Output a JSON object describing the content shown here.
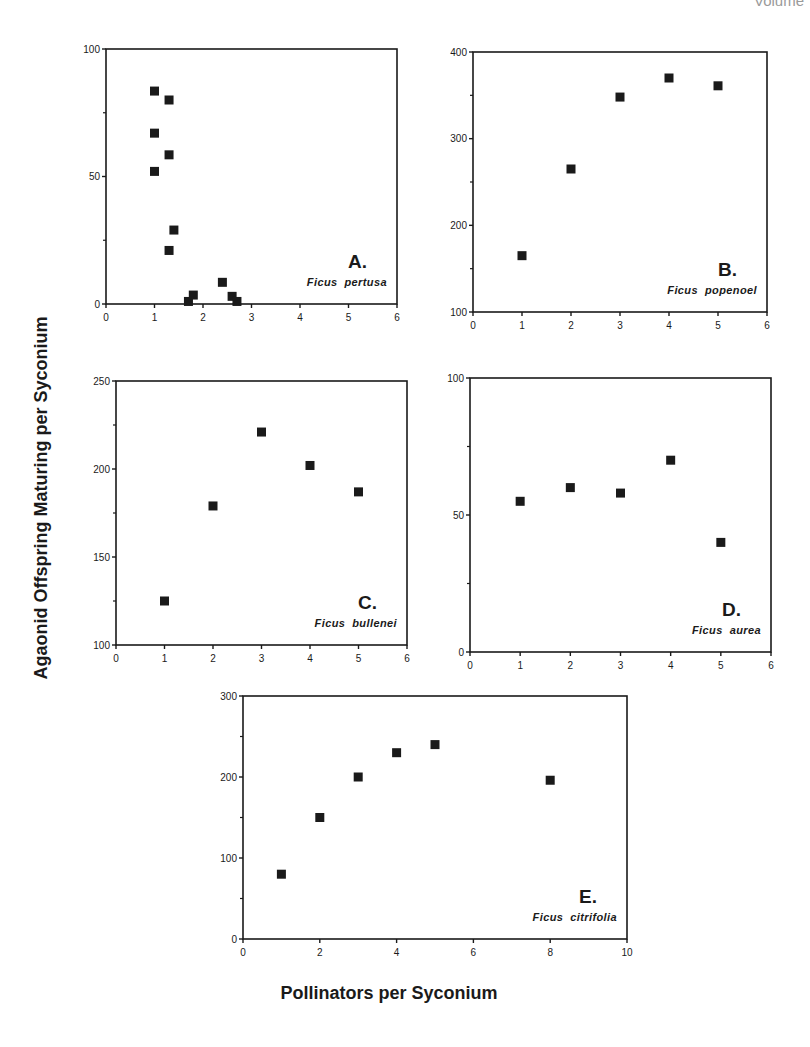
{
  "page": {
    "header_fragment": "Volume"
  },
  "axes": {
    "ylabel": "Agaonid Offspring Maturing per Syconium",
    "xlabel": "Pollinators per Syconium"
  },
  "chart_data": [
    {
      "type": "scatter",
      "panel": "A.",
      "species": "Ficus  pertusa",
      "xlim": [
        0,
        6
      ],
      "ylim": [
        0,
        100
      ],
      "xticks": [
        0,
        1,
        2,
        3,
        4,
        5,
        6
      ],
      "yticks": [
        0,
        50,
        100
      ],
      "yminor": [
        25,
        75
      ],
      "frame": {
        "x0": 106,
        "x1": 397,
        "y0": 49,
        "y1": 304
      },
      "points": [
        [
          1.0,
          83.5
        ],
        [
          1.3,
          80
        ],
        [
          1.0,
          67
        ],
        [
          1.3,
          58.5
        ],
        [
          1.0,
          52
        ],
        [
          1.4,
          29
        ],
        [
          1.3,
          21
        ],
        [
          1.7,
          1
        ],
        [
          1.8,
          3.5
        ],
        [
          2.4,
          8.5
        ],
        [
          2.6,
          3
        ],
        [
          2.7,
          1
        ]
      ]
    },
    {
      "type": "scatter",
      "panel": "B.",
      "species": "Ficus  popenoel",
      "xlim": [
        0,
        6
      ],
      "ylim": [
        100,
        400
      ],
      "xticks": [
        0,
        1,
        2,
        3,
        4,
        5,
        6
      ],
      "yticks": [
        100,
        200,
        300,
        400
      ],
      "yminor": [
        150,
        250,
        350
      ],
      "frame": {
        "x0": 473,
        "x1": 767,
        "y0": 52,
        "y1": 312
      },
      "points": [
        [
          1,
          165
        ],
        [
          2,
          265
        ],
        [
          3,
          348
        ],
        [
          4,
          370
        ],
        [
          5,
          361
        ]
      ]
    },
    {
      "type": "scatter",
      "panel": "C.",
      "species": "Ficus  bullenei",
      "xlim": [
        0,
        6
      ],
      "ylim": [
        100,
        250
      ],
      "xticks": [
        0,
        1,
        2,
        3,
        4,
        5,
        6
      ],
      "yticks": [
        100,
        150,
        200,
        250
      ],
      "yminor": [
        125,
        175,
        225
      ],
      "frame": {
        "x0": 116,
        "x1": 407,
        "y0": 381,
        "y1": 645
      },
      "points": [
        [
          1,
          125
        ],
        [
          2,
          179
        ],
        [
          3,
          221
        ],
        [
          4,
          202
        ],
        [
          5,
          187
        ]
      ]
    },
    {
      "type": "scatter",
      "panel": "D.",
      "species": "Ficus  aurea",
      "xlim": [
        0,
        6
      ],
      "ylim": [
        0,
        100
      ],
      "xticks": [
        0,
        1,
        2,
        3,
        4,
        5,
        6
      ],
      "yticks": [
        0,
        50,
        100
      ],
      "yminor": [
        25,
        75
      ],
      "frame": {
        "x0": 470,
        "x1": 771,
        "y0": 378,
        "y1": 652
      },
      "points": [
        [
          1,
          55
        ],
        [
          2,
          60
        ],
        [
          3,
          58
        ],
        [
          4,
          70
        ],
        [
          5,
          40
        ]
      ]
    },
    {
      "type": "scatter",
      "panel": "E.",
      "species": "Ficus  citrifolia",
      "xlim": [
        0,
        10
      ],
      "ylim": [
        0,
        300
      ],
      "xticks": [
        0,
        2,
        4,
        6,
        8,
        10
      ],
      "yticks": [
        0,
        100,
        200,
        300
      ],
      "yminor": [
        50,
        150,
        250
      ],
      "frame": {
        "x0": 243,
        "x1": 627,
        "y0": 696,
        "y1": 939
      },
      "points": [
        [
          1,
          80
        ],
        [
          2,
          150
        ],
        [
          3,
          200
        ],
        [
          4,
          230
        ],
        [
          5,
          240
        ],
        [
          8,
          196
        ]
      ]
    }
  ],
  "colors": {
    "ink": "#1a1a1a",
    "background": "#ffffff"
  }
}
